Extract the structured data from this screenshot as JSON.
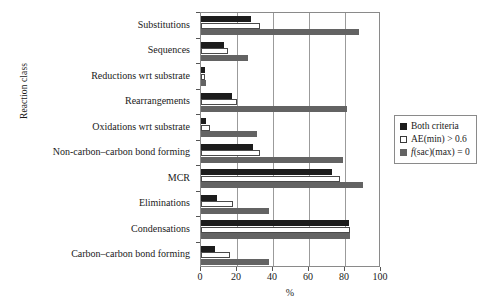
{
  "chart_data": {
    "type": "bar",
    "orientation": "horizontal",
    "title": "",
    "xlabel": "%",
    "ylabel": "Reaction class",
    "xlim": [
      0,
      100
    ],
    "xticks": [
      0,
      20,
      40,
      60,
      80,
      100
    ],
    "grid": "vertical",
    "legend_position": "right",
    "categories": [
      "Substitutions",
      "Sequences",
      "Reductions wrt substrate",
      "Rearrangements",
      "Oxidations wrt substrate",
      "Non-carbon–carbon bond forming",
      "MCR",
      "Eliminations",
      "Condensations",
      "Carbon–carbon bond forming"
    ],
    "series": [
      {
        "name": "Both criteria",
        "color": "#1c1c1c",
        "values": [
          28,
          13,
          2,
          17,
          3,
          29,
          73,
          9,
          82,
          8
        ]
      },
      {
        "name": "AE(min) > 0.6",
        "color": "#ffffff",
        "values": [
          33,
          15,
          2,
          20,
          5,
          33,
          77,
          18,
          83,
          16
        ]
      },
      {
        "name": "f(sac)(max) = 0",
        "color": "#636363",
        "values": [
          88,
          26,
          3,
          81,
          31,
          79,
          90,
          38,
          83,
          38
        ]
      }
    ]
  },
  "legend": {
    "items": [
      {
        "label": "Both criteria",
        "swatch": "both"
      },
      {
        "label": "AE(min) > 0.6",
        "swatch": "ae"
      },
      {
        "label": "f(sac)(max) = 0",
        "swatch": "fsac"
      }
    ],
    "item3_italic_prefix": "f",
    "item3_rest": "(sac)(max) = 0"
  }
}
